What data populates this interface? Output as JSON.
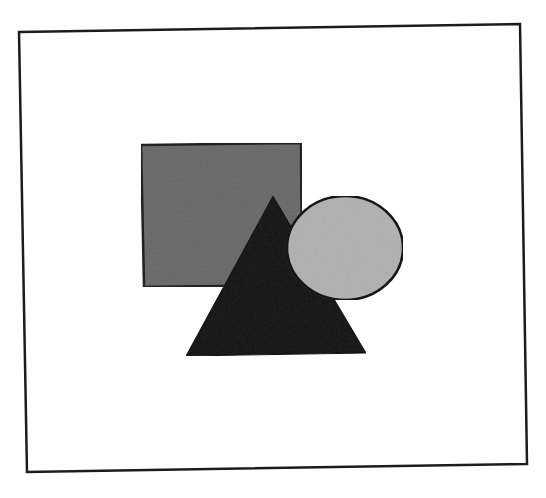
{
  "diagram": {
    "background": "#ffffff",
    "frame": {
      "points": "19,32 520,24 527,464 27,472",
      "stroke": "#1c1c1c",
      "stroke_width": 2.5,
      "fill": "#ffffff"
    },
    "shapes": [
      {
        "id": "square",
        "kind": "rectangle",
        "points": "141,145 301,143 302,285 144,287",
        "fill": "#6e6e6e",
        "stroke": "#222222",
        "stroke_width": 2.5
      },
      {
        "id": "triangle",
        "kind": "triangle",
        "points": "273,196 366,353 186,356",
        "fill": "#1a1a1a",
        "stroke": "#111111",
        "stroke_width": 1
      },
      {
        "id": "circle",
        "kind": "ellipse",
        "cx": 345,
        "cy": 248,
        "rx": 58,
        "ry": 52,
        "fill": "#b4b4b4",
        "stroke": "#141414",
        "stroke_width": 2.5
      }
    ]
  }
}
